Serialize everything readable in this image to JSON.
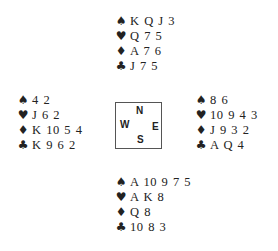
{
  "suits": {
    "spades": "♠",
    "hearts": "♥",
    "diamonds": "♦",
    "clubs": "♣"
  },
  "hands": {
    "north": {
      "spades": "K Q J 3",
      "hearts": "Q 7 5",
      "diamonds": "A 7 6",
      "clubs": "J 7 5"
    },
    "west": {
      "spades": "4 2",
      "hearts": "J 6 2",
      "diamonds": "K 10 5 4",
      "clubs": "K 9 6 2"
    },
    "east": {
      "spades": "8 6",
      "hearts": "10 9 4 3",
      "diamonds": "J 9 3 2",
      "clubs": "A Q 4"
    },
    "south": {
      "spades": "A 10 9 7 5",
      "hearts": "A K 8",
      "diamonds": "Q 8",
      "clubs": "10 8 3"
    }
  },
  "compass": {
    "n": "N",
    "s": "S",
    "w": "W",
    "e": "E"
  }
}
